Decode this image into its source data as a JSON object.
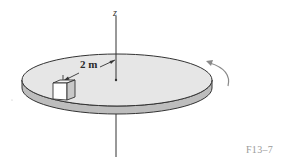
{
  "figure": {
    "axis_label": "z",
    "distance_label": "2 m",
    "figure_id": "F13–7",
    "objects": [
      "rotating disk",
      "block (cube) on disk",
      "vertical z-axis",
      "rotation direction arrow"
    ]
  },
  "colors": {
    "disk_top": "#e6e6e6",
    "disk_rim": "#bdbdbd",
    "outline": "#333333",
    "cube_front": "#ffffff",
    "cube_side": "#c8c8c8",
    "arrow": "#8a8a8a",
    "fig_label": "#9a9a9a"
  }
}
